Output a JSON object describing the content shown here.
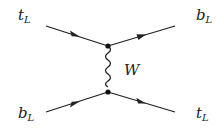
{
  "diagram": {
    "type": "feynman",
    "particles": {
      "in_top": {
        "name": "t",
        "sub": "L"
      },
      "in_bottom": {
        "name": "b",
        "sub": "L"
      },
      "out_top": {
        "name": "b",
        "sub": "L"
      },
      "out_bottom": {
        "name": "t",
        "sub": "L"
      },
      "propagator": {
        "name": "W"
      }
    },
    "line_color": "#222222"
  }
}
